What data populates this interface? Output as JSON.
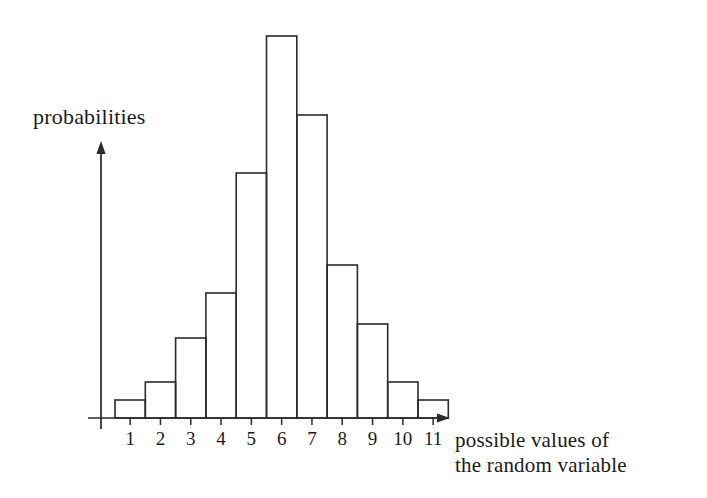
{
  "figure": {
    "width": 707,
    "height": 498,
    "background": "#ffffff",
    "ink_color": "#2b2b2b"
  },
  "labels": {
    "y_axis_title": "probabilities",
    "x_axis_title_line1": "possible values of",
    "x_axis_title_line2": "the random variable"
  },
  "chart_data": {
    "type": "bar",
    "title": "",
    "subtitle": "",
    "xlabel": "possible values of the random variable",
    "ylabel": "probabilities",
    "categories": [
      "1",
      "2",
      "3",
      "4",
      "5",
      "6",
      "7",
      "8",
      "9",
      "10",
      "11"
    ],
    "values": [
      0.012,
      0.024,
      0.054,
      0.084,
      0.164,
      0.256,
      0.203,
      0.103,
      0.063,
      0.024,
      0.012
    ],
    "bar_pixel_heights": [
      18,
      36,
      80,
      125,
      245,
      382,
      303,
      153,
      94,
      36,
      18
    ],
    "xlim": [
      0.5,
      11.5
    ],
    "ylim": [
      0,
      0.27
    ],
    "grid": false,
    "legend": null,
    "legend_position": "none",
    "axis_style": "arrow-tipped open axes, no y tick labels",
    "bar_style": "unfilled outline rectangles, contiguous, centered on integer ticks",
    "annotations": []
  },
  "geometry": {
    "baseline_y": 418,
    "y_axis_x": 101,
    "y_axis_arrow_tip_y": 141,
    "y_axis_bottom_y": 429,
    "x_axis_left_x": 88,
    "x_axis_arrow_tip_x": 450,
    "bar_left_start_x": 115,
    "bar_width": 30.3,
    "max_bar_pixel_height": 382,
    "tick_length": 7
  }
}
